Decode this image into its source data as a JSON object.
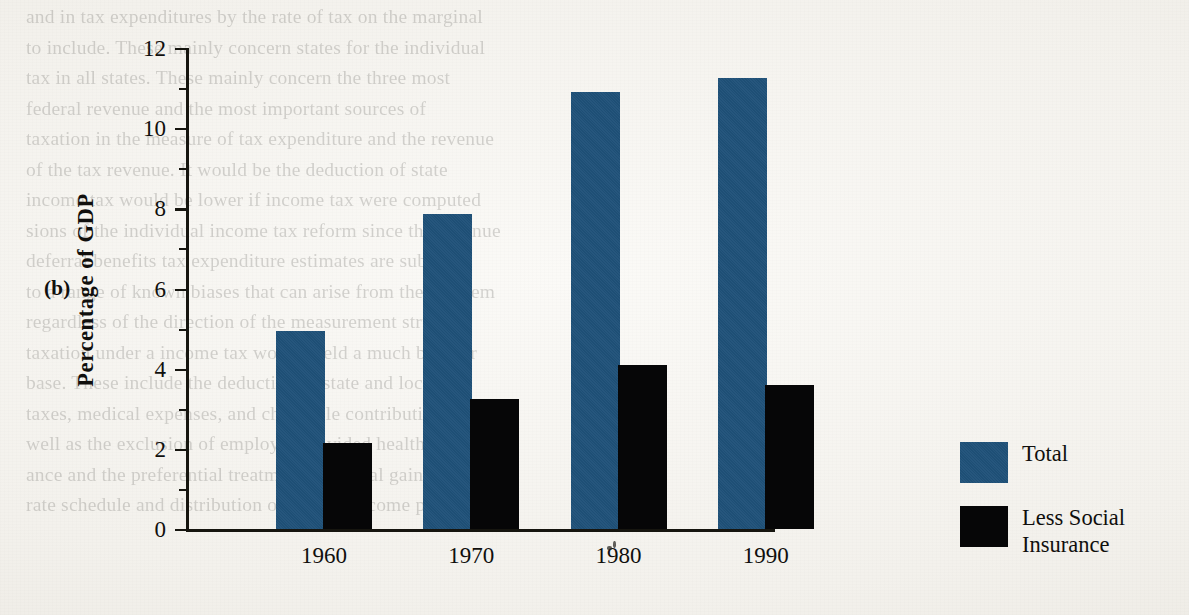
{
  "figure": {
    "panel_label": "(b)",
    "ylabel": "Percentage of GDP"
  },
  "chart_data": {
    "type": "bar",
    "title": "",
    "xlabel": "",
    "ylabel": "Percentage of GDP",
    "categories": [
      "1960",
      "1970",
      "1980",
      "1990"
    ],
    "series": [
      {
        "name": "Total",
        "color": "#1f5179",
        "values": [
          4.95,
          7.85,
          10.9,
          11.25
        ]
      },
      {
        "name": "Less Social Insurance",
        "color": "#060607",
        "values": [
          2.15,
          3.25,
          4.1,
          3.6
        ]
      }
    ],
    "ylim": [
      0,
      12
    ],
    "yticks_major": [
      0,
      2,
      4,
      6,
      8,
      10,
      12
    ],
    "ytick_labels": [
      "0",
      "2",
      "4",
      "6",
      "8",
      "10",
      "12"
    ],
    "yticks_minor": [
      1,
      3,
      5,
      7,
      9,
      11
    ],
    "grid": false,
    "legend_position": "right"
  },
  "legend": {
    "entries": [
      {
        "label": "Total",
        "swatch": "#1f5179"
      },
      {
        "label": "Less Social Insurance",
        "swatch": "#060607"
      }
    ]
  },
  "ghost_text": {
    "lines": [
      "and in tax expenditures by the rate of tax on the marginal",
      "to include. These mainly concern states for the individual",
      "tax in all states. These mainly concern the three most",
      "federal revenue and the most important sources of",
      "taxation in the measure of tax expenditure and the revenue",
      "of the tax revenue. It would be the deduction of state",
      "income tax would be lower if income tax were computed",
      "sions of the individual income tax reform since the revenue",
      "deferral benefits tax expenditure estimates are subject",
      "to a range of known biases that can arise from the problem",
      "regardless of the direction of the measurement structure",
      "taxation under a income tax would yield a much broader",
      "base. These include the deduction of state and local",
      "taxes, medical expenses, and charitable contributions as",
      "well as the exclusion of employer provided health insur-",
      "ance and the preferential treatment of capital gains income.",
      "rate schedule and distribution of taxable income proportions"
    ]
  }
}
